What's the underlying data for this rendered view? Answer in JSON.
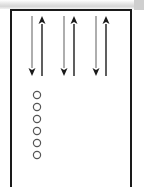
{
  "figure": {
    "title": "",
    "caption": "",
    "background_color": "#ffffff",
    "border_color": "#1a1a1a",
    "border_width_px": 2
  },
  "frame": {
    "name": "diagram-frame",
    "x": 10,
    "y": 9,
    "width": 122,
    "height": 186,
    "bottom_open": true
  },
  "top_band": {
    "name": "page-edge-band",
    "height_px": 9,
    "color": "#d6d6d6"
  },
  "arrow_style": {
    "down_color": "#8c8c8c",
    "up_color": "#1a1a1a",
    "shaft_width_px": 1.4,
    "head_width_px": 7,
    "head_length_px": 8
  },
  "arrow_pairs": [
    {
      "name": "arrow-pair-1",
      "down_arrow": {
        "name": "down-arrow-1",
        "x": 32,
        "y_top": 16,
        "y_bottom": 76,
        "direction": "down",
        "color": "#8c8c8c"
      },
      "up_arrow": {
        "name": "up-arrow-1",
        "x": 42,
        "y_top": 16,
        "y_bottom": 76,
        "direction": "up",
        "color": "#1a1a1a"
      }
    },
    {
      "name": "arrow-pair-2",
      "down_arrow": {
        "name": "down-arrow-2",
        "x": 64,
        "y_top": 16,
        "y_bottom": 76,
        "direction": "down",
        "color": "#8c8c8c"
      },
      "up_arrow": {
        "name": "up-arrow-2",
        "x": 74,
        "y_top": 16,
        "y_bottom": 76,
        "direction": "up",
        "color": "#1a1a1a"
      }
    },
    {
      "name": "arrow-pair-3",
      "down_arrow": {
        "name": "down-arrow-3",
        "x": 96,
        "y_top": 16,
        "y_bottom": 76,
        "direction": "down",
        "color": "#8c8c8c"
      },
      "up_arrow": {
        "name": "up-arrow-3",
        "x": 106,
        "y_top": 16,
        "y_bottom": 76,
        "direction": "up",
        "color": "#1a1a1a"
      }
    }
  ],
  "circle_column": {
    "name": "circle-column",
    "count": 6,
    "center_x": 37,
    "radius_px": 3.6,
    "stroke_color": "#555555",
    "stroke_width_px": 1.2,
    "fill": "none",
    "circles": [
      {
        "name": "circle-1",
        "cx": 37,
        "cy": 95
      },
      {
        "name": "circle-2",
        "cx": 37,
        "cy": 107
      },
      {
        "name": "circle-3",
        "cx": 37,
        "cy": 119
      },
      {
        "name": "circle-4",
        "cx": 37,
        "cy": 131
      },
      {
        "name": "circle-5",
        "cx": 37,
        "cy": 143
      },
      {
        "name": "circle-6",
        "cx": 37,
        "cy": 155
      }
    ]
  }
}
